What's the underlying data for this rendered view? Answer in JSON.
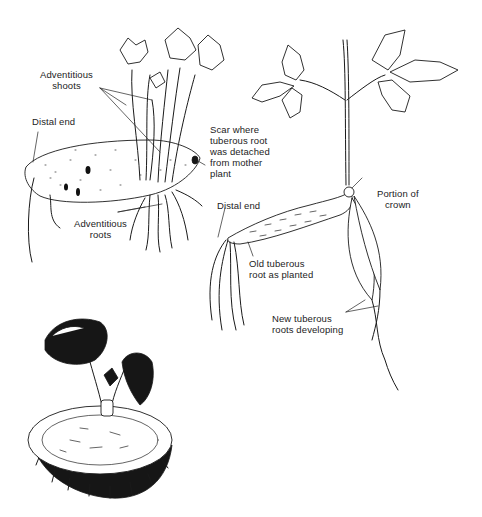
{
  "figure": {
    "panels": [
      {
        "id": "sweet-potato-sprouting",
        "labels": {
          "adventitious_shoots": "Adventitious\nshoots",
          "distal_end": "Distal end",
          "scar": "Scar where\ntuberous root\nwas detached\nfrom mother\nplant",
          "adventitious_roots": "Adventitious\nroots"
        }
      },
      {
        "id": "planted-tuberous-root",
        "labels": {
          "portion_of_crown": "Portion of\ncrown",
          "distal_end": "Distal end",
          "old_tuberous_root": "Old tuberous\nroot as planted",
          "new_tuberous_roots": "New tuberous\nroots developing"
        }
      },
      {
        "id": "tuber-slice-with-sprout",
        "labels": {}
      }
    ]
  }
}
